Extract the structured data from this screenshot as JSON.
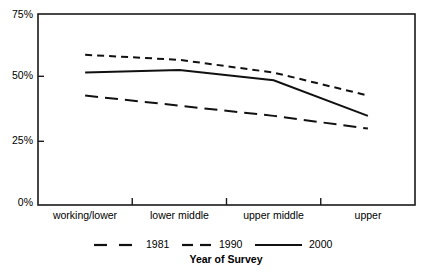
{
  "chart_data": {
    "type": "line",
    "title": "",
    "xlabel": "Year of Survey",
    "ylabel": "",
    "categories": [
      "working/lower",
      "lower middle",
      "upper middle",
      "upper"
    ],
    "ylim": [
      0,
      75
    ],
    "ytick_labels": [
      "0%",
      "25%",
      "50%",
      "75%"
    ],
    "ytick_values": [
      0,
      25,
      50,
      75
    ],
    "grid": false,
    "legend_position": "bottom",
    "series": [
      {
        "name": "1981",
        "style": "long-dash",
        "values": [
          43,
          39,
          35,
          30
        ]
      },
      {
        "name": "1990",
        "style": "short-dash",
        "values": [
          59,
          57,
          52,
          43
        ]
      },
      {
        "name": "2000",
        "style": "solid",
        "values": [
          52,
          53,
          49,
          35
        ]
      }
    ]
  },
  "axis": {
    "x_title": "Year of Survey",
    "y_ticks": [
      {
        "label": "75%",
        "value": 75
      },
      {
        "label": "50%",
        "value": 50
      },
      {
        "label": "25%",
        "value": 25
      },
      {
        "label": "0%",
        "value": 0
      }
    ],
    "x_ticks": [
      {
        "label": "working/lower"
      },
      {
        "label": "lower middle"
      },
      {
        "label": "upper middle"
      },
      {
        "label": "upper"
      }
    ]
  },
  "legend": {
    "items": [
      {
        "label": "1981",
        "style": "long-dash"
      },
      {
        "label": "1990",
        "style": "short-dash"
      },
      {
        "label": "2000",
        "style": "solid"
      }
    ]
  },
  "colors": {
    "line": "#111111",
    "axis": "#1a1a1a",
    "background": "#ffffff",
    "text": "#000000"
  }
}
